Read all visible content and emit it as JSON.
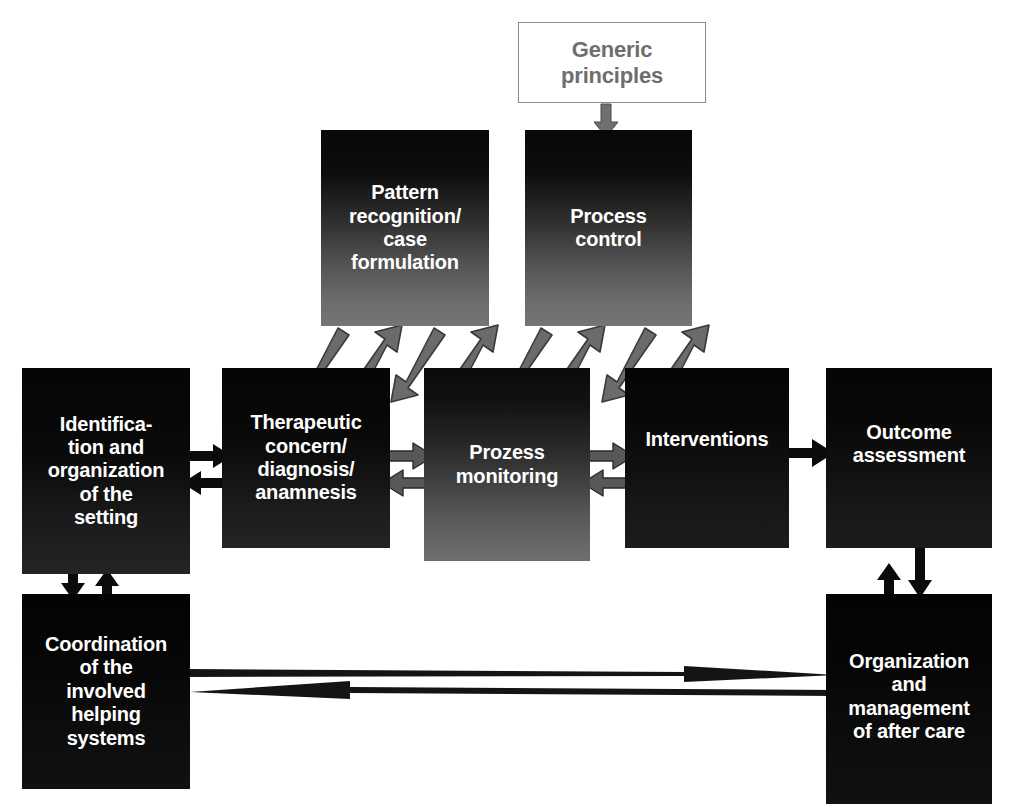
{
  "diagram": {
    "background": "#ffffff",
    "colors": {
      "gray_arrow": "#6b6b6b",
      "gray_arrow_stroke": "#2f2f2f",
      "black_arrow": "#0b0b0b",
      "white_box_border": "#8a8a8a",
      "white_box_text": "#6e6e6e",
      "node_text": "#ffffff"
    },
    "nodes": [
      {
        "id": "generic-principles",
        "label": "Generic\nprinciples",
        "x": 518,
        "y": 22,
        "w": 188,
        "h": 81,
        "style": "fill-white",
        "font": 22
      },
      {
        "id": "pattern-recognition",
        "label": "Pattern\nrecognition/\ncase\nformulation",
        "x": 321,
        "y": 130,
        "w": 168,
        "h": 196,
        "style": "fill-grad-strong",
        "font": 20
      },
      {
        "id": "process-control",
        "label": "Process\ncontrol",
        "x": 525,
        "y": 130,
        "w": 167,
        "h": 196,
        "style": "fill-grad-strong",
        "font": 20
      },
      {
        "id": "identification",
        "label": "Identifica-\ntion and\norganization\nof the\nsetting",
        "x": 22,
        "y": 368,
        "w": 168,
        "h": 206,
        "style": "fill-grad-soft",
        "font": 20
      },
      {
        "id": "therapeutic-concern",
        "label": "Therapeutic\nconcern/\ndiagnosis/\nanamnesis",
        "x": 222,
        "y": 368,
        "w": 168,
        "h": 180,
        "style": "fill-grad-soft",
        "font": 20
      },
      {
        "id": "prozess-monitoring",
        "label": "Prozess\nmonitoring",
        "x": 424,
        "y": 368,
        "w": 166,
        "h": 193,
        "style": "fill-grad-mid",
        "font": 20
      },
      {
        "id": "interventions",
        "label": "Interventions",
        "x": 625,
        "y": 368,
        "w": 164,
        "h": 180,
        "style": "fill-grad-dark",
        "font": 20
      },
      {
        "id": "outcome-assessment",
        "label": "Outcome\nassessment",
        "x": 826,
        "y": 368,
        "w": 166,
        "h": 180,
        "style": "fill-grad-dark",
        "font": 20
      },
      {
        "id": "coordination",
        "label": "Coordination\nof the\ninvolved\nhelping\nsystems",
        "x": 22,
        "y": 594,
        "w": 168,
        "h": 195,
        "style": "fill-black",
        "font": 20
      },
      {
        "id": "after-care",
        "label": "Organization\nand\nmanagement\nof after care",
        "x": 826,
        "y": 594,
        "w": 166,
        "h": 210,
        "style": "fill-black",
        "font": 20
      }
    ],
    "edges": [
      {
        "id": "principles-to-process-control",
        "kind": "vertical-gray-arrow",
        "from": "generic-principles",
        "to": "process-control"
      },
      {
        "id": "pattern-therapeutic-pair",
        "kind": "diagonal-gray-double",
        "from": "pattern-recognition",
        "to": "therapeutic-concern"
      },
      {
        "id": "pattern-prozess-pair",
        "kind": "diagonal-gray-double",
        "from": "pattern-recognition",
        "to": "prozess-monitoring"
      },
      {
        "id": "control-prozess-pair",
        "kind": "diagonal-gray-double",
        "from": "process-control",
        "to": "prozess-monitoring"
      },
      {
        "id": "control-interventions-pair",
        "kind": "diagonal-gray-double",
        "from": "process-control",
        "to": "interventions"
      },
      {
        "id": "identification-therapeutic",
        "kind": "horizontal-black-double",
        "from": "identification",
        "to": "therapeutic-concern"
      },
      {
        "id": "therapeutic-prozess",
        "kind": "horizontal-gray-double",
        "from": "therapeutic-concern",
        "to": "prozess-monitoring"
      },
      {
        "id": "prozess-interventions",
        "kind": "horizontal-gray-double",
        "from": "prozess-monitoring",
        "to": "interventions"
      },
      {
        "id": "interventions-outcome",
        "kind": "horizontal-black-single",
        "from": "interventions",
        "to": "outcome-assessment"
      },
      {
        "id": "identification-coordination",
        "kind": "vertical-black-double",
        "from": "identification",
        "to": "coordination"
      },
      {
        "id": "outcome-aftercare",
        "kind": "vertical-black-double",
        "from": "outcome-assessment",
        "to": "after-care"
      },
      {
        "id": "coordination-to-aftercare",
        "kind": "long-thin-arrow-right",
        "from": "coordination",
        "to": "after-care"
      },
      {
        "id": "aftercare-to-coordination",
        "kind": "long-thin-arrow-left",
        "from": "after-care",
        "to": "coordination"
      }
    ]
  }
}
